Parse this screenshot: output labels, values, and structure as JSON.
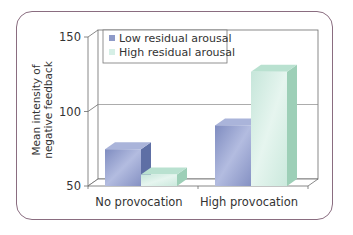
{
  "chart_data": {
    "type": "bar",
    "title": "",
    "xlabel": "",
    "ylabel": "Mean intensity of negative feedback",
    "ylabel_lines": [
      "Mean intensity of",
      "negative feedback"
    ],
    "categories": [
      "No provocation",
      "High provocation"
    ],
    "series": [
      {
        "name": "Low residual arousal",
        "values": [
          74,
          90
        ],
        "color": "#8e9ac8"
      },
      {
        "name": "High residual arousal",
        "values": [
          57,
          126
        ],
        "color": "#cfeae0"
      }
    ],
    "yticks": [
      50,
      100,
      150
    ],
    "ytick_labels": [
      "50",
      "100",
      "150"
    ],
    "ylim": [
      50,
      150
    ],
    "grid": true,
    "legend_position": "top-left",
    "style": "3d"
  },
  "colors": {
    "frame_border": "#8a6d80",
    "axis": "#6b6b6b",
    "low_front": "#8e9ac8",
    "low_side": "#5e6fa5",
    "low_top": "#aab4da",
    "high_front": "#d6efe6",
    "high_side": "#9dcfb7",
    "high_top": "#b9e1d0"
  }
}
